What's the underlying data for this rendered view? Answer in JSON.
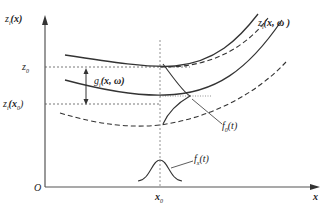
{
  "diagram": {
    "y_axis_label": "zᵢ(x)",
    "y_axis_label_parts": {
      "fn": "z",
      "sub": "i",
      "arg": "(x)"
    },
    "x_axis_label": "x",
    "origin_label": "O",
    "tick_z0": {
      "fn": "z",
      "sub": "0"
    },
    "tick_zix0": {
      "fn": "z",
      "sub": "i",
      "arg": "(x",
      "argsub": "0",
      "close": ")"
    },
    "x0_label": {
      "fn": "x",
      "sub": "0"
    },
    "curve_label": {
      "fn": "z",
      "sub": "i",
      "arg": "(x, ω )"
    },
    "gap_label": {
      "fn": "g",
      "sub": "i",
      "arg": "(x, ω)"
    },
    "f0_label": {
      "fn": "f",
      "sub": "0",
      "arg": "(t)"
    },
    "fx_label": {
      "fn": "f",
      "sub": "x",
      "arg": "(t)"
    },
    "colors": {
      "line": "#333333",
      "dashed": "#444444",
      "axis": "#555555"
    }
  }
}
